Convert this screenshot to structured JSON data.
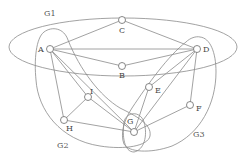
{
  "diagram": {
    "type": "graph-with-groups",
    "nodes": [
      {
        "id": "A",
        "label": "A",
        "x": 50,
        "y": 49
      },
      {
        "id": "B",
        "label": "B",
        "x": 122,
        "y": 66
      },
      {
        "id": "C",
        "label": "C",
        "x": 122,
        "y": 20
      },
      {
        "id": "D",
        "label": "D",
        "x": 197,
        "y": 49
      },
      {
        "id": "E",
        "label": "E",
        "x": 149,
        "y": 87
      },
      {
        "id": "F",
        "label": "F",
        "x": 190,
        "y": 105
      },
      {
        "id": "G",
        "label": "G",
        "x": 134,
        "y": 132
      },
      {
        "id": "H",
        "label": "H",
        "x": 64,
        "y": 120
      },
      {
        "id": "I",
        "label": "I",
        "x": 88,
        "y": 97
      }
    ],
    "edges": [
      [
        "A",
        "C"
      ],
      [
        "A",
        "D"
      ],
      [
        "A",
        "B"
      ],
      [
        "A",
        "H"
      ],
      [
        "A",
        "I"
      ],
      [
        "A",
        "G"
      ],
      [
        "C",
        "D"
      ],
      [
        "B",
        "D"
      ],
      [
        "D",
        "E"
      ],
      [
        "D",
        "G"
      ],
      [
        "D",
        "F"
      ],
      [
        "I",
        "H"
      ],
      [
        "I",
        "G"
      ],
      [
        "H",
        "G"
      ],
      [
        "G",
        "F"
      ],
      [
        "G",
        "E"
      ]
    ],
    "groups": [
      {
        "id": "G1",
        "label": "G1",
        "members": [
          "A",
          "B",
          "C",
          "D"
        ]
      },
      {
        "id": "G2",
        "label": "G2",
        "members": [
          "A",
          "G",
          "H",
          "I"
        ]
      },
      {
        "id": "G3",
        "label": "G3",
        "members": [
          "D",
          "E",
          "F",
          "G"
        ]
      }
    ],
    "group_labels": {
      "g1": "G1",
      "g2": "G2",
      "g3": "G3"
    },
    "node_labels": {
      "a": "A",
      "b": "B",
      "c": "C",
      "d": "D",
      "e": "E",
      "f": "F",
      "g": "G",
      "h": "H",
      "i": "I"
    }
  }
}
